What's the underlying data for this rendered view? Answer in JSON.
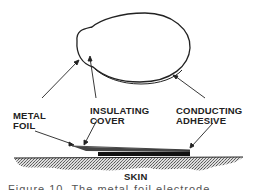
{
  "figure": {
    "labels": {
      "metal_foil": [
        "METAL",
        "FOIL"
      ],
      "insulating_cover": [
        "INSULATING",
        "COVER"
      ],
      "conducting_adhesive": [
        "CONDUCTING",
        "ADHESIVE"
      ],
      "skin": "SKIN"
    },
    "caption": "Figure 10.  The metal-foil electrode"
  }
}
